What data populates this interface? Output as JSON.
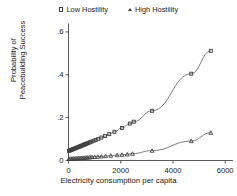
{
  "chart_data": {
    "type": "line",
    "title": "",
    "xlabel": "Electricity consumption per capita",
    "ylabel": "Probability of\nPeacebuilding Success",
    "ylabel_line1": "Probability of",
    "ylabel_line2": "Peacebuilding Success",
    "xlim": [
      0,
      6300
    ],
    "ylim": [
      0,
      0.63
    ],
    "xticks": [
      0,
      2000,
      4000,
      6000
    ],
    "xtick_labels": [
      "0",
      "2000",
      "4000",
      "6000"
    ],
    "yticks": [
      0,
      0.2,
      0.4,
      0.6
    ],
    "ytick_labels": [
      "0",
      ".2",
      ".4",
      ".6"
    ],
    "grid": false,
    "legend_position": "top",
    "marker_color": "#3d3d3d",
    "line_color": "#555555",
    "axis_color": "#4a4a4a",
    "series": [
      {
        "name": "Low Hostility",
        "marker": "square",
        "x": [
          20,
          60,
          100,
          140,
          180,
          220,
          260,
          300,
          340,
          380,
          420,
          460,
          500,
          540,
          580,
          620,
          660,
          700,
          760,
          820,
          880,
          960,
          1040,
          1140,
          1260,
          1400,
          1560,
          1760,
          2050,
          2350,
          2500,
          3200,
          4700,
          5450
        ],
        "y": [
          0.045,
          0.047,
          0.049,
          0.051,
          0.053,
          0.055,
          0.057,
          0.059,
          0.061,
          0.063,
          0.065,
          0.067,
          0.069,
          0.071,
          0.073,
          0.075,
          0.077,
          0.079,
          0.082,
          0.085,
          0.088,
          0.092,
          0.096,
          0.101,
          0.107,
          0.114,
          0.123,
          0.134,
          0.152,
          0.172,
          0.181,
          0.232,
          0.405,
          0.512
        ]
      },
      {
        "name": "High Hostility",
        "marker": "triangle",
        "x": [
          20,
          80,
          140,
          200,
          260,
          320,
          380,
          440,
          500,
          560,
          620,
          680,
          740,
          820,
          900,
          1000,
          1120,
          1260,
          1420,
          1620,
          1860,
          2050,
          2250,
          2450,
          3200,
          4700,
          5450
        ],
        "y": [
          0.008,
          0.0085,
          0.009,
          0.0095,
          0.01,
          0.0105,
          0.011,
          0.0115,
          0.012,
          0.0125,
          0.013,
          0.0135,
          0.014,
          0.015,
          0.016,
          0.017,
          0.018,
          0.019,
          0.021,
          0.023,
          0.025,
          0.027,
          0.029,
          0.032,
          0.046,
          0.091,
          0.13
        ]
      }
    ]
  },
  "legend": {
    "entries": [
      {
        "label": "Low Hostility",
        "marker": "square"
      },
      {
        "label": "High Hostility",
        "marker": "triangle"
      }
    ]
  }
}
